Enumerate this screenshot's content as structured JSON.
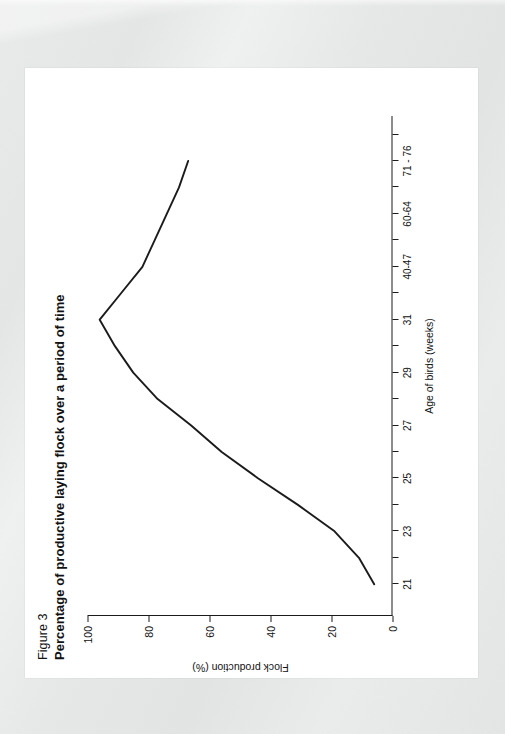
{
  "page": {
    "figure_number": "Figure 3",
    "title": "Percentage of productive laying flock over a period of time"
  },
  "chart_data": {
    "type": "line",
    "title": "Percentage of productive laying flock over a period of time",
    "figure_label": "Figure 3",
    "xlabel": "Age of birds (weeks)",
    "ylabel": "Flock production (%)",
    "categories": [
      "21",
      "23",
      "25",
      "27",
      "29",
      "31",
      "40-47",
      "60-64",
      "71 - 76"
    ],
    "x_tick_labels": [
      "21",
      "23",
      "25",
      "27",
      "29",
      "31",
      "40-47",
      "60-64",
      "71 - 76"
    ],
    "minor_ticks_between_labels": 1,
    "y_tick_labels": [
      "0",
      "20",
      "40",
      "60",
      "80",
      "100"
    ],
    "ylim": [
      0,
      100
    ],
    "ylabel_unit": "%",
    "grid": false,
    "legend": false,
    "line_color": "#1b1b1b",
    "values": [
      6,
      19,
      44,
      66,
      85,
      96,
      82,
      74,
      67
    ],
    "points": [
      {
        "x": "21",
        "y": 6
      },
      {
        "x": "22",
        "y": 11
      },
      {
        "x": "23",
        "y": 19
      },
      {
        "x": "24",
        "y": 31
      },
      {
        "x": "25",
        "y": 44
      },
      {
        "x": "26",
        "y": 56
      },
      {
        "x": "27",
        "y": 66
      },
      {
        "x": "28",
        "y": 77
      },
      {
        "x": "29",
        "y": 85
      },
      {
        "x": "30",
        "y": 91
      },
      {
        "x": "31",
        "y": 96
      },
      {
        "x": "35",
        "y": 89
      },
      {
        "x": "40-47",
        "y": 82
      },
      {
        "x": "54",
        "y": 78
      },
      {
        "x": "60-64",
        "y": 74
      },
      {
        "x": "68",
        "y": 70
      },
      {
        "x": "71 - 76",
        "y": 67
      }
    ]
  }
}
